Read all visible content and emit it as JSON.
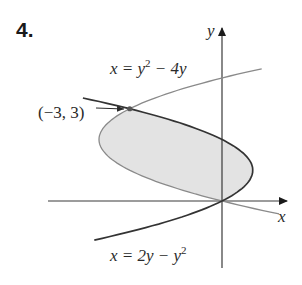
{
  "problem": {
    "number": "4."
  },
  "axes": {
    "x_label": "x",
    "y_label": "y",
    "origin_px": [
      222,
      201
    ],
    "unit_px": 30.75
  },
  "curves": [
    {
      "name": "upper-parabola",
      "equation_lhs": "x = y",
      "equation_sup": "2",
      "equation_rhs": " − 4y",
      "full": "x = y^2 − 4y",
      "color": "#8a8a8a"
    },
    {
      "name": "lower-parabola",
      "equation_lhs": "x = 2y − y",
      "equation_sup": "2",
      "full": "x = 2y − y^2",
      "color": "#333333"
    }
  ],
  "intersection": {
    "label": "(−3, 3)",
    "x": -3,
    "y": 3
  },
  "region": {
    "fill": "#e3e3e3",
    "description": "Region between x = y^2 − 4y and x = 2y − y^2 for 0 ≤ y ≤ 3"
  },
  "colors": {
    "axis": "#3a3a3a",
    "shade": "#e3e3e3",
    "light_curve": "#8a8a8a",
    "dark_curve": "#333333"
  }
}
